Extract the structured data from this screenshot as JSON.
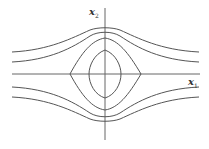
{
  "diagram": {
    "type": "phase-portrait",
    "axes": {
      "x_label": "x",
      "x_subscript": "1",
      "y_label": "x",
      "y_subscript": "2"
    },
    "trajectories": {
      "closed_orbits": 2,
      "open_curves_above": 2,
      "open_curves_below": 2
    },
    "colors": {
      "curve": "#555555",
      "axis": "#666666",
      "background": "#ffffff"
    }
  }
}
